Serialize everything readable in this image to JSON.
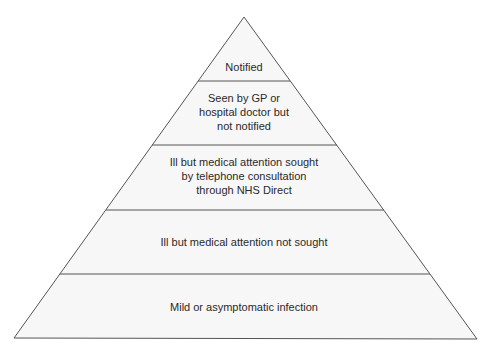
{
  "diagram": {
    "type": "pyramid",
    "colors": {
      "stroke": "#555555",
      "fill": "#f7f7f7",
      "text": "#2a2a2a"
    },
    "levels": [
      {
        "id": "notified",
        "label": "Notified",
        "lines": [
          "Notified"
        ]
      },
      {
        "id": "seen-by-gp",
        "label": "Seen by GP or hospital doctor but not notified",
        "lines": [
          "Seen by GP or",
          "hospital doctor but",
          "not notified"
        ]
      },
      {
        "id": "telephone-consultation",
        "label": "Ill but medical attention sought by telephone consultation through NHS Direct",
        "lines": [
          "Ill but medical attention sought",
          "by telephone consultation",
          "through NHS Direct"
        ]
      },
      {
        "id": "not-sought",
        "label": "Ill but medical attention not sought",
        "lines": [
          "Ill but medical attention not sought"
        ]
      },
      {
        "id": "mild-asymptomatic",
        "label": "Mild or asymptomatic infection",
        "lines": [
          "Mild or asymptomatic infection"
        ]
      }
    ]
  }
}
